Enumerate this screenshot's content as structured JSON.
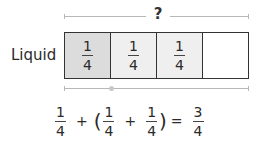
{
  "diagram": {
    "top_label": "?",
    "row_label": "Liquid",
    "cells": [
      {
        "numerator": "1",
        "denominator": "4",
        "fill": "#dcdcdc"
      },
      {
        "numerator": "1",
        "denominator": "4",
        "fill": "#efefef"
      },
      {
        "numerator": "1",
        "denominator": "4",
        "fill": "#efefef"
      },
      {
        "numerator": "",
        "denominator": "",
        "fill": "#ffffff"
      }
    ],
    "colors": {
      "border": "#333333",
      "bracket": "#b8b8b8",
      "first_cell": "#dcdcdc",
      "shaded_cell": "#efefef",
      "empty_cell": "#ffffff"
    }
  },
  "equation": {
    "terms": [
      {
        "numerator": "1",
        "denominator": "4"
      },
      {
        "op": "+"
      },
      {
        "paren": "("
      },
      {
        "numerator": "1",
        "denominator": "4"
      },
      {
        "op": "+"
      },
      {
        "numerator": "1",
        "denominator": "4"
      },
      {
        "paren": ")"
      },
      {
        "op": "="
      },
      {
        "numerator": "3",
        "denominator": "4"
      }
    ],
    "t1": {
      "num": "1",
      "den": "4"
    },
    "plus1": "+",
    "open_paren": "(",
    "t2": {
      "num": "1",
      "den": "4"
    },
    "plus2": "+",
    "t3": {
      "num": "1",
      "den": "4"
    },
    "close_paren": ")",
    "equals": "=",
    "result": {
      "num": "3",
      "den": "4"
    }
  }
}
